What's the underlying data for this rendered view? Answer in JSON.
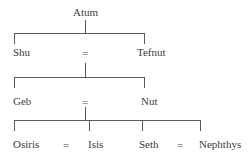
{
  "diagram": {
    "type": "genealogy",
    "generations": [
      {
        "level": 1,
        "members": [
          {
            "name": "Atum"
          }
        ]
      },
      {
        "level": 2,
        "couple": {
          "left": "Shu",
          "symbol": "=",
          "right": "Tefnut"
        }
      },
      {
        "level": 3,
        "couple": {
          "left": "Geb",
          "symbol": "=",
          "right": "Nut"
        }
      },
      {
        "level": 4,
        "couples": [
          {
            "left": "Osiris",
            "symbol": "=",
            "right": "Isis"
          },
          {
            "left": "Seth",
            "symbol": "=",
            "right": "Nephthys"
          }
        ]
      }
    ]
  },
  "labels": {
    "atum": "Atum",
    "shu": "Shu",
    "tefnut": "Tefnut",
    "geb": "Geb",
    "nut": "Nut",
    "osiris": "Osiris",
    "isis": "Isis",
    "seth": "Seth",
    "nephthys": "Nephthys",
    "marriage_symbol": "="
  },
  "colors": {
    "line": "#5a5a5a",
    "text": "#3c3c3c",
    "background": "#ffffff"
  }
}
